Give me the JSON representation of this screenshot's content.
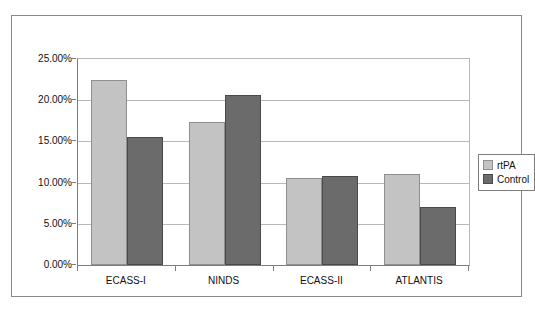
{
  "chart_data": {
    "type": "bar",
    "title": "",
    "subtitle": "",
    "xlabel": "",
    "ylabel": "",
    "categories": [
      "ECASS-I",
      "NINDS",
      "ECASS-II",
      "ATLANTIS"
    ],
    "series": [
      {
        "name": "rtPA",
        "values": [
          22.5,
          17.4,
          10.6,
          11.0
        ],
        "color": "#c3c3c3"
      },
      {
        "name": "Control",
        "values": [
          15.5,
          20.6,
          10.8,
          7.0
        ],
        "color": "#6b6b6b"
      }
    ],
    "ylim": [
      0,
      25
    ],
    "ytick_values": [
      0,
      5,
      10,
      15,
      20,
      25
    ],
    "ytick_labels": [
      "0.00%",
      "5.00%",
      "10.00%",
      "15.00%",
      "20.00%",
      "25.00%"
    ],
    "grid": true,
    "legend_position": "right",
    "value_format": "percent"
  },
  "legend": {
    "entries": [
      {
        "label": "rtPA",
        "swatch": "light-gray-square"
      },
      {
        "label": "Control",
        "swatch": "dark-gray-square"
      }
    ]
  }
}
